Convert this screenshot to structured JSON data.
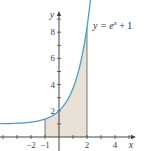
{
  "chart_data": {
    "type": "area",
    "title": "",
    "function": "e^x + 1",
    "curve_label": {
      "prefix": "y = e",
      "sup": "x",
      "suffix": " + 1"
    },
    "xlabel": "x",
    "ylabel": "y",
    "xlim": [
      -4.2,
      5
    ],
    "ylim": [
      -0.9,
      10
    ],
    "x_ticks": [
      -4,
      -3,
      -2,
      -1,
      0,
      1,
      2,
      3,
      4,
      5
    ],
    "x_tick_labels": [
      {
        "value": -2,
        "text": "−2"
      },
      {
        "value": -1,
        "text": "−1"
      },
      {
        "value": 2,
        "text": "2"
      },
      {
        "value": 4,
        "text": "4"
      }
    ],
    "y_ticks": [
      1,
      2,
      3,
      4,
      5,
      6,
      7,
      8,
      9
    ],
    "y_tick_labels": [
      {
        "value": 2,
        "text": "2"
      },
      {
        "value": 4,
        "text": "4"
      },
      {
        "value": 6,
        "text": "6"
      },
      {
        "value": 8,
        "text": "8"
      }
    ],
    "shaded_region": {
      "x_from": -1,
      "x_to": 2,
      "under": "e^x + 1"
    },
    "grid": false,
    "colors": {
      "curve": "#4b9fc4",
      "fill": "#e9e0d6",
      "axis": "#444444",
      "bound": "#555555"
    }
  }
}
